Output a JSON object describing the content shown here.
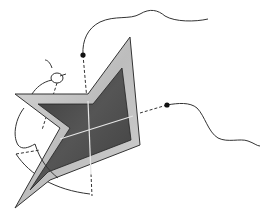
{
  "diagram": {
    "colors": {
      "background": "#ffffff",
      "outer_frame": "#c8c8c8",
      "inner_plate": "#4a4a4a",
      "axis_lines": "#e6e6e6",
      "strings": "#333333",
      "dots": "#111111"
    },
    "elements": [
      {
        "name": "star-plate",
        "type": "chevron-star polygon"
      },
      {
        "name": "vertical-axis",
        "type": "dashed/solid axis"
      },
      {
        "name": "horizontal-axis",
        "type": "dashed/solid axis"
      },
      {
        "name": "top-string",
        "type": "curve with anchor dot"
      },
      {
        "name": "right-string",
        "type": "curve with anchor dot"
      },
      {
        "name": "left-loop",
        "type": "loop curve"
      }
    ]
  }
}
